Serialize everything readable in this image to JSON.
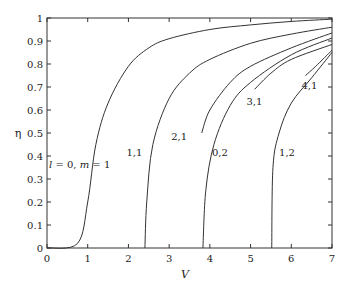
{
  "chart_data": {
    "type": "line",
    "title": "",
    "xlabel": "V",
    "ylabel": "η",
    "xlim": [
      0,
      7
    ],
    "ylim": [
      0,
      1
    ],
    "xticks": [
      0,
      1,
      2,
      3,
      4,
      5,
      6,
      7
    ],
    "yticks": [
      0,
      0.1,
      0.2,
      0.3,
      0.4,
      0.5,
      0.6,
      0.7,
      0.8,
      0.9,
      1
    ],
    "grid": false,
    "legend": "none (inline curve labels)",
    "colors": {
      "line": "#333333",
      "axis": "#333333",
      "text": "#222222"
    },
    "series": [
      {
        "name": "l = 0, m = 1",
        "label": "l = 0, m = 1",
        "x": [
          0,
          0.75,
          1.0,
          1.2,
          1.5,
          2.0,
          2.5,
          3.0,
          4.0,
          5.0,
          6.0,
          7.0
        ],
        "y": [
          0,
          0.02,
          0.2,
          0.45,
          0.63,
          0.79,
          0.87,
          0.91,
          0.95,
          0.97,
          0.985,
          0.995
        ]
      },
      {
        "name": "1,1",
        "label": "1,1",
        "x": [
          2.405,
          2.45,
          2.6,
          3.0,
          3.5,
          4.0,
          5.0,
          6.0,
          7.0
        ],
        "y": [
          0,
          0.2,
          0.45,
          0.65,
          0.76,
          0.82,
          0.89,
          0.93,
          0.96
        ]
      },
      {
        "name": "2,1",
        "label": "2,1",
        "x": [
          3.8,
          4.0,
          4.5,
          5.0,
          6.0,
          7.0
        ],
        "y": [
          0.5,
          0.6,
          0.72,
          0.79,
          0.87,
          0.935
        ]
      },
      {
        "name": "0,2",
        "label": "0,2",
        "x": [
          3.83,
          3.9,
          4.1,
          4.5,
          5.0,
          6.0,
          7.0
        ],
        "y": [
          0,
          0.25,
          0.45,
          0.62,
          0.72,
          0.84,
          0.913
        ]
      },
      {
        "name": "3,1",
        "label": "3,1",
        "x": [
          5.1,
          5.5,
          6.0,
          7.0
        ],
        "y": [
          0.69,
          0.76,
          0.82,
          0.885
        ]
      },
      {
        "name": "1,2",
        "label": "1,2",
        "x": [
          5.52,
          5.55,
          5.7,
          6.0,
          6.5,
          7.0
        ],
        "y": [
          0,
          0.35,
          0.5,
          0.63,
          0.74,
          0.85
        ]
      },
      {
        "name": "4,1",
        "label": "4,1",
        "x": [
          6.35,
          6.6,
          7.0
        ],
        "y": [
          0.75,
          0.79,
          0.86
        ]
      }
    ],
    "annotations": [
      {
        "text": "l = 0, m = 1",
        "x": 0.05,
        "y": 0.35
      },
      {
        "text": "1,1",
        "x": 1.95,
        "y": 0.4
      },
      {
        "text": "2,1",
        "x": 3.05,
        "y": 0.47
      },
      {
        "text": "0,2",
        "x": 4.05,
        "y": 0.4
      },
      {
        "text": "3,1",
        "x": 4.9,
        "y": 0.62
      },
      {
        "text": "1,2",
        "x": 5.7,
        "y": 0.4
      },
      {
        "text": "4,1",
        "x": 6.25,
        "y": 0.69
      }
    ]
  }
}
